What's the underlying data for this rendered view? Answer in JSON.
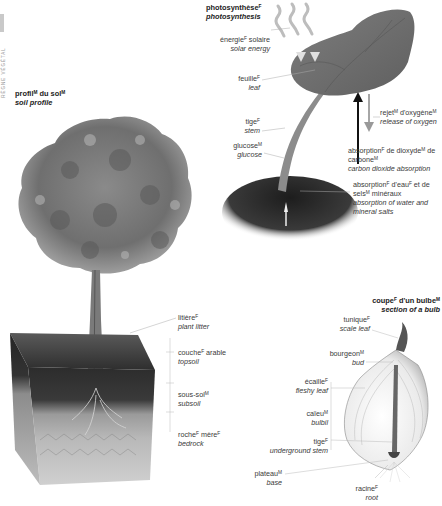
{
  "side_tab": {
    "text": "RÈGNE VÉGÉTAL"
  },
  "soil_profile": {
    "title_fr": "profil",
    "title_fr_g1": "M",
    "title_fr2": " du sol",
    "title_fr_g2": "M",
    "title_en": "soil profile",
    "labels": [
      {
        "fr": "litière",
        "g": "F",
        "en": "plant litter"
      },
      {
        "fr": "couche",
        "g": "F",
        "fr2": " arable",
        "en": "topsoil"
      },
      {
        "fr": "sous-sol",
        "g": "M",
        "en": "subsoil"
      },
      {
        "fr": "roche",
        "g": "F",
        "fr2": " mère",
        "g2": "F",
        "en": "bedrock"
      }
    ]
  },
  "photosynthesis": {
    "title_fr": "photosynthèse",
    "title_g": "F",
    "title_en": "photosynthesis",
    "labels": {
      "solar": {
        "fr": "énergie",
        "g": "F",
        "fr2": " solaire",
        "en": "solar energy"
      },
      "leaf": {
        "fr": "feuille",
        "g": "F",
        "en": "leaf"
      },
      "stem": {
        "fr": "tige",
        "g": "F",
        "en": "stem"
      },
      "glucose": {
        "fr": "glucose",
        "g": "M",
        "en": "glucose"
      },
      "oxygen": {
        "fr": "rejet",
        "g": "M",
        "fr2": " d'oxygène",
        "g2": "M",
        "en": "release of oxygen"
      },
      "co2": {
        "fr": "absorption",
        "g": "F",
        "fr2": " de dioxyde",
        "g2": "M",
        "fr3": " de carbone",
        "g3": "M",
        "en": "carbon dioxide absorption"
      },
      "water": {
        "fr": "absorption",
        "g": "F",
        "fr2": " d'eau",
        "g2": "F",
        "fr3": " et de sels",
        "g3": "M",
        "fr4": " minéraux",
        "en": "absorption of water and mineral salts"
      }
    }
  },
  "bulb": {
    "title_fr": "coupe",
    "title_g": "F",
    "title_fr2": " d'un bulbe",
    "title_g2": "M",
    "title_en": "section of a bulb",
    "labels": {
      "scale_leaf": {
        "fr": "tunique",
        "g": "F",
        "en": "scale leaf"
      },
      "bud": {
        "fr": "bourgeon",
        "g": "M",
        "en": "bud"
      },
      "fleshy_leaf": {
        "fr": "écaille",
        "g": "F",
        "en": "fleshy leaf"
      },
      "bulbil": {
        "fr": "caïeu",
        "g": "M",
        "en": "bulbil"
      },
      "underground_stem": {
        "fr": "tige",
        "g": "F",
        "en": "underground stem"
      },
      "base": {
        "fr": "plateau",
        "g": "M",
        "en": "base"
      },
      "root": {
        "fr": "racine",
        "g": "F",
        "en": "root"
      }
    }
  }
}
